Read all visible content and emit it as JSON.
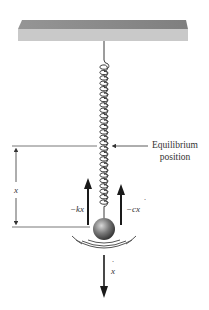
{
  "diagram": {
    "labels": {
      "equilibrium_line1": "Equilibrium",
      "equilibrium_line2": "position",
      "displacement": "x",
      "spring_force": "−kx",
      "damping_force": "−c",
      "damping_force_var": "x",
      "damping_force_dot": "˙",
      "velocity": "x",
      "velocity_dot": "˙"
    },
    "colors": {
      "ceiling_top": "#8a8a8a",
      "ceiling_front": "#c8c8c8",
      "line": "#333333",
      "arrow": "#1a1a1a",
      "mass_light": "#bdbdbd",
      "mass_dark": "#3a3a3a"
    }
  }
}
